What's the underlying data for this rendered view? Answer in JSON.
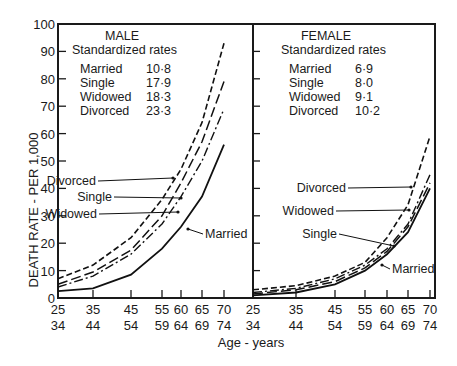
{
  "chart_data": {
    "type": "line",
    "xlabel": "Age - years",
    "ylabel": "DEATH RATE - PER 1,000",
    "ylim": [
      0,
      100
    ],
    "yticks": [
      0,
      10,
      20,
      30,
      40,
      50,
      60,
      70,
      80,
      90,
      100
    ],
    "x_categories": [
      {
        "top": "25",
        "bottom": "34",
        "start": 25
      },
      {
        "top": "35",
        "bottom": "44",
        "start": 35
      },
      {
        "top": "45",
        "bottom": "54",
        "start": 45
      },
      {
        "top": "55",
        "bottom": "59",
        "start": 55
      },
      {
        "top": "60",
        "bottom": "64",
        "start": 60
      },
      {
        "top": "65",
        "bottom": "69",
        "start": 65
      },
      {
        "top": "70",
        "bottom": "74",
        "start": 70
      }
    ],
    "panels": [
      {
        "title": "MALE",
        "legend_title": "Standardized rates",
        "standardized_rates": [
          {
            "name": "Married",
            "value": "10·8"
          },
          {
            "name": "Single",
            "value": "17·9"
          },
          {
            "name": "Widowed",
            "value": "18·3"
          },
          {
            "name": "Divorced",
            "value": "23·3"
          }
        ],
        "series": [
          {
            "name": "Married",
            "style": "solid",
            "values": [
              2.5,
              3.5,
              8.5,
              18,
              26,
              37,
              56
            ]
          },
          {
            "name": "Widowed",
            "style": "dashdot",
            "values": [
              4,
              8,
              16,
              27,
              37,
              50,
              69
            ]
          },
          {
            "name": "Single",
            "style": "longdash",
            "values": [
              5,
              9.5,
              17.5,
              30,
              42,
              57,
              79
            ]
          },
          {
            "name": "Divorced",
            "style": "dashed",
            "values": [
              7,
              12,
              22,
              36,
              47,
              64,
              93
            ]
          }
        ],
        "annotations": [
          {
            "text": "Divorced",
            "series": "Divorced"
          },
          {
            "text": "Single",
            "series": "Single"
          },
          {
            "text": "Widowed",
            "series": "Widowed"
          },
          {
            "text": "Married",
            "series": "Married"
          }
        ]
      },
      {
        "title": "FEMALE",
        "legend_title": "Standardized rates",
        "standardized_rates": [
          {
            "name": "Married",
            "value": "6·9"
          },
          {
            "name": "Single",
            "value": "8·0"
          },
          {
            "name": "Widowed",
            "value": "9·1"
          },
          {
            "name": "Divorced",
            "value": "10·2"
          }
        ],
        "series": [
          {
            "name": "Married",
            "style": "solid",
            "values": [
              1,
              2,
              5,
              10,
              16,
              24,
              40
            ]
          },
          {
            "name": "Single",
            "style": "longdash",
            "values": [
              1.5,
              3,
              6,
              11,
              17,
              26,
              42
            ]
          },
          {
            "name": "Widowed",
            "style": "dashdot",
            "values": [
              2,
              3.5,
              7,
              12,
              18,
              27,
              45
            ]
          },
          {
            "name": "Divorced",
            "style": "dashed",
            "values": [
              3,
              4.5,
              8,
              13,
              22,
              34,
              59
            ]
          }
        ],
        "annotations": [
          {
            "text": "Divorced",
            "series": "Divorced"
          },
          {
            "text": "Widowed",
            "series": "Widowed"
          },
          {
            "text": "Single",
            "series": "Single"
          },
          {
            "text": "Married",
            "series": "Married"
          }
        ]
      }
    ],
    "grid": false
  }
}
